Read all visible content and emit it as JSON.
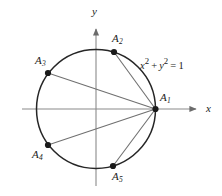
{
  "figure": {
    "axis_labels": {
      "x": "x",
      "y": "y"
    },
    "equation": {
      "full": "x² + y² = 1",
      "var_x": "x",
      "sup_x": "2",
      "plus": "+",
      "var_y": "y",
      "sup_y": "2",
      "equals": "=",
      "rhs": "1"
    },
    "colors": {
      "curve": "#222222",
      "axis": "#888888",
      "chord": "#6f6f6f",
      "point": "#1a1a1a",
      "text": "#1a1a1a",
      "background": "#ffffff"
    },
    "circle": {
      "cx": 96,
      "cy": 109,
      "r": 59.5,
      "equation": "x^2 + y^2 = 1"
    },
    "points": [
      {
        "id": "A1",
        "label": "A",
        "sub": "1",
        "cx": 155.5,
        "cy": 109,
        "label_x": 160,
        "label_y": 94
      },
      {
        "id": "A2",
        "label": "A",
        "sub": "2",
        "cx": 114,
        "cy": 52,
        "label_x": 112,
        "label_y": 34
      },
      {
        "id": "A3",
        "label": "A",
        "sub": "3",
        "cx": 48,
        "cy": 73,
        "label_x": 36,
        "label_y": 56
      },
      {
        "id": "A4",
        "label": "A",
        "sub": "4",
        "cx": 48,
        "cy": 145,
        "label_x": 33,
        "label_y": 150
      },
      {
        "id": "A5",
        "label": "A",
        "sub": "5",
        "cx": 113,
        "cy": 166,
        "label_x": 112,
        "label_y": 172
      }
    ],
    "chords": [
      {
        "from": "A1",
        "to": "A2"
      },
      {
        "from": "A1",
        "to": "A3"
      },
      {
        "from": "A1",
        "to": "A4"
      },
      {
        "from": "A1",
        "to": "A5"
      }
    ],
    "axes": {
      "x_line": {
        "x1": 22,
        "y1": 109,
        "x2": 200,
        "y2": 109
      },
      "y_line": {
        "x1": 96,
        "y1": 186,
        "x2": 96,
        "y2": 25
      },
      "x_label_pos": {
        "x": 205,
        "y": 103
      },
      "y_label_pos": {
        "x": 92,
        "y": 6
      }
    },
    "equation_pos": {
      "x": 140,
      "y": 57
    }
  }
}
